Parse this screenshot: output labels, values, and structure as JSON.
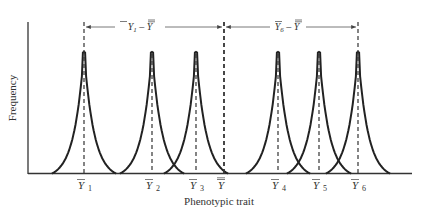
{
  "figure": {
    "type": "diagram",
    "ylabel": "Frequency",
    "xlabel": "Phenotypic trait",
    "colors": {
      "curve": "#222222",
      "axis": "#333333",
      "dashed": "#333333",
      "arrow": "#555555",
      "background": "#ffffff"
    },
    "means": [
      {
        "id": "Y1",
        "symbol": "Y",
        "subscript": "1",
        "bar": "single",
        "x": 84
      },
      {
        "id": "Y2",
        "symbol": "Y",
        "subscript": "2",
        "bar": "single",
        "x": 152
      },
      {
        "id": "Y3",
        "symbol": "Y",
        "subscript": "3",
        "bar": "single",
        "x": 196
      },
      {
        "id": "Ygrand",
        "symbol": "Y",
        "subscript": "",
        "bar": "double",
        "x": 224
      },
      {
        "id": "Y4",
        "symbol": "Y",
        "subscript": "4",
        "bar": "single",
        "x": 278
      },
      {
        "id": "Y5",
        "symbol": "Y",
        "subscript": "5",
        "bar": "single",
        "x": 319
      },
      {
        "id": "Y6",
        "symbol": "Y",
        "subscript": "6",
        "bar": "single",
        "x": 358
      }
    ],
    "deviations": [
      {
        "label_main": "Y",
        "label_sub": "1",
        "label_minus": " – ",
        "label_grand": "Y",
        "from": "Y1",
        "to": "Ygrand"
      },
      {
        "label_main": "Y",
        "label_sub": "6",
        "label_minus": " – ",
        "label_grand": "Y",
        "from": "Ygrand",
        "to": "Y6"
      }
    ]
  }
}
